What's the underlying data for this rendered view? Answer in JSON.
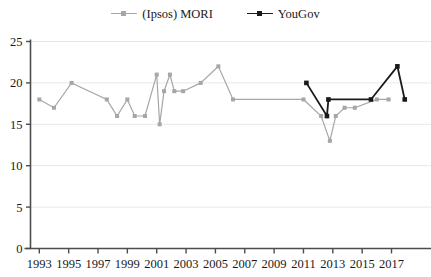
{
  "chart_data": {
    "type": "line",
    "title": "",
    "subtitle": "",
    "xlabel": "",
    "ylabel": "",
    "xlim": [
      1992.4,
      1992.4
    ],
    "ylim": [
      0,
      25
    ],
    "grid": true,
    "legend_position": "top-center",
    "y_ticks": [
      0,
      5,
      10,
      15,
      20,
      25
    ],
    "x_ticks": [
      1993,
      1995,
      1997,
      1999,
      2001,
      2003,
      2005,
      2007,
      2009,
      2011,
      2013,
      2015,
      2017
    ],
    "x_tick_labels": [
      "1993",
      "1995",
      "1997",
      "1999",
      "2001",
      "2003",
      "2005",
      "2007",
      "2009",
      "2011",
      "2013",
      "2015",
      "2017"
    ],
    "y_tick_labels": [
      "0",
      "5",
      "10",
      "15",
      "20",
      "25"
    ],
    "series": [
      {
        "name": "(Ipsos) MORI",
        "color": "#a6a6a6",
        "marker": "square",
        "points": [
          {
            "x": 1993.0,
            "y": 18
          },
          {
            "x": 1994.0,
            "y": 17
          },
          {
            "x": 1995.2,
            "y": 20
          },
          {
            "x": 1997.6,
            "y": 18
          },
          {
            "x": 1998.3,
            "y": 16
          },
          {
            "x": 1999.0,
            "y": 18
          },
          {
            "x": 1999.5,
            "y": 16
          },
          {
            "x": 2000.2,
            "y": 16
          },
          {
            "x": 2001.0,
            "y": 21
          },
          {
            "x": 2001.2,
            "y": 15
          },
          {
            "x": 2001.5,
            "y": 19
          },
          {
            "x": 2001.9,
            "y": 21
          },
          {
            "x": 2002.2,
            "y": 19
          },
          {
            "x": 2002.8,
            "y": 19
          },
          {
            "x": 2004.0,
            "y": 20
          },
          {
            "x": 2005.2,
            "y": 22
          },
          {
            "x": 2006.2,
            "y": 18
          },
          {
            "x": 2011.0,
            "y": 18
          },
          {
            "x": 2012.2,
            "y": 16
          },
          {
            "x": 2012.8,
            "y": 13
          },
          {
            "x": 2013.2,
            "y": 16
          },
          {
            "x": 2013.8,
            "y": 17
          },
          {
            "x": 2014.5,
            "y": 17
          },
          {
            "x": 2016.0,
            "y": 18
          },
          {
            "x": 2016.8,
            "y": 18
          }
        ]
      },
      {
        "name": "YouGov",
        "color": "#1a1a1a",
        "marker": "square",
        "points": [
          {
            "x": 2011.2,
            "y": 20
          },
          {
            "x": 2012.6,
            "y": 16
          },
          {
            "x": 2012.7,
            "y": 18
          },
          {
            "x": 2015.6,
            "y": 18
          },
          {
            "x": 2017.4,
            "y": 22
          },
          {
            "x": 2017.9,
            "y": 18
          }
        ]
      }
    ]
  },
  "legend": {
    "entries": [
      {
        "label": "(Ipsos) MORI",
        "color": "#a6a6a6"
      },
      {
        "label": "YouGov",
        "color": "#1a1a1a"
      }
    ]
  },
  "axes": {
    "axis_color": "#4d4d4d",
    "grid_color": "#e8e8e8"
  }
}
